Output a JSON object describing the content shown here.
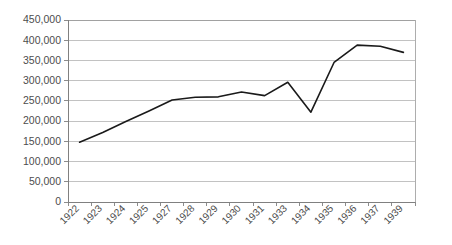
{
  "chart_data": {
    "type": "line",
    "title": "",
    "subtitle": "",
    "xlabel": "",
    "ylabel": "",
    "categories": [
      "1922",
      "1923",
      "1924",
      "1925",
      "1927",
      "1928",
      "1929",
      "1930",
      "1931",
      "1933",
      "1934",
      "1935",
      "1936",
      "1937",
      "1939"
    ],
    "series": [
      {
        "name": "",
        "values": [
          148000,
          172000,
          199000,
          225000,
          252000,
          259000,
          260000,
          272000,
          263000,
          296000,
          222000,
          345000,
          388000,
          385000,
          370000
        ]
      }
    ],
    "ylim": [
      0,
      450000
    ],
    "ytick_values": [
      0,
      50000,
      100000,
      150000,
      200000,
      250000,
      300000,
      350000,
      400000,
      450000
    ],
    "ytick_labels": [
      "0",
      "50,000",
      "100,000",
      "150,000",
      "200,000",
      "250,000",
      "300,000",
      "350,000",
      "400,000",
      "450,000"
    ],
    "grid": true,
    "grid_axis": "y",
    "legend": false,
    "legend_position": "none",
    "line_color": "#1a1a1a",
    "grid_color": "#b3b3b3",
    "axis_color": "#808080",
    "tick_label_color": "#4d4d4d",
    "background_color": "#ffffff",
    "xtick_label_rotation": 45,
    "markers": false
  },
  "layout": {
    "plot_left": 68,
    "plot_right": 415,
    "plot_top": 20,
    "plot_bottom": 202,
    "width": 452,
    "height": 245
  }
}
